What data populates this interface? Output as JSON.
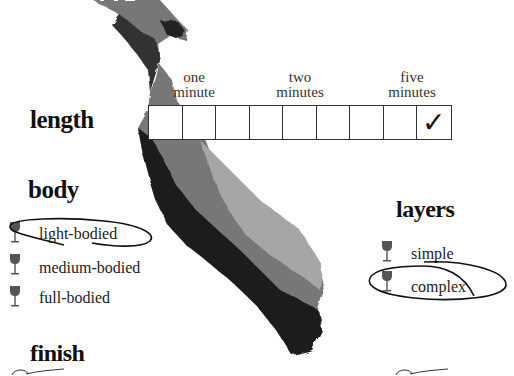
{
  "length": {
    "heading": "length",
    "tick_labels": [
      {
        "line1": "one",
        "line2": "minute"
      },
      {
        "line1": "two",
        "line2": "minutes"
      },
      {
        "line1": "five",
        "line2": "minutes"
      }
    ],
    "cells": [
      "",
      "",
      "",
      "",
      "",
      "",
      "",
      "",
      "✓"
    ],
    "checked_index": 8
  },
  "body": {
    "heading": "body",
    "options": [
      {
        "label": "light-bodied",
        "selected": true
      },
      {
        "label": "medium-bodied",
        "selected": false
      },
      {
        "label": "full-bodied",
        "selected": false
      }
    ]
  },
  "layers": {
    "heading": "layers",
    "options": [
      {
        "label": "simple",
        "selected": false
      },
      {
        "label": "complex",
        "selected": true
      }
    ]
  },
  "finish": {
    "heading": "finish"
  },
  "colors": {
    "ink": "#111111",
    "glass": "#555555",
    "map_dark": "#1a1a1a",
    "map_light": "#9a9a9a"
  }
}
